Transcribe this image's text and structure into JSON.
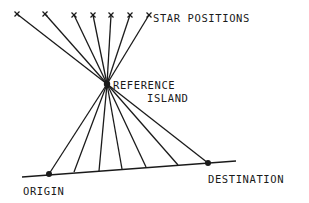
{
  "labels": {
    "star_positions": "STAR POSITIONS",
    "reference_line1": "REFERENCE",
    "reference_line2": "ISLAND",
    "origin": "ORIGIN",
    "destination": "DESTINATION"
  },
  "diagram": {
    "stroke_color": "#1a1a1a",
    "reference_island": {
      "x": 107,
      "y": 84
    },
    "stars": [
      {
        "x": 17,
        "y": 14
      },
      {
        "x": 45,
        "y": 14
      },
      {
        "x": 74,
        "y": 15
      },
      {
        "x": 93,
        "y": 15
      },
      {
        "x": 111,
        "y": 15
      },
      {
        "x": 130,
        "y": 15
      },
      {
        "x": 149,
        "y": 15
      }
    ],
    "baseline": {
      "x1": 22,
      "y1": 177,
      "x2": 236,
      "y2": 161
    },
    "baseline_points": [
      {
        "x": 49,
        "y": 174,
        "type": "origin"
      },
      {
        "x": 74,
        "y": 172,
        "type": "tick"
      },
      {
        "x": 99,
        "y": 171,
        "type": "tick"
      },
      {
        "x": 122,
        "y": 169,
        "type": "tick"
      },
      {
        "x": 146,
        "y": 167,
        "type": "tick"
      },
      {
        "x": 178,
        "y": 165,
        "type": "tick"
      },
      {
        "x": 208,
        "y": 163,
        "type": "destination"
      }
    ]
  }
}
